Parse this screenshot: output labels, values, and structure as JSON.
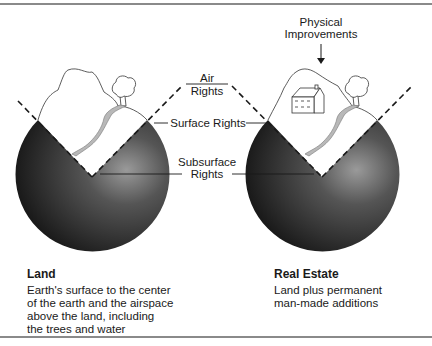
{
  "labels": {
    "physical_improvements_line1": "Physical",
    "physical_improvements_line2": "Improvements",
    "air_rights_line1": "Air",
    "air_rights_line2": "Rights",
    "surface_rights": "Surface Rights",
    "subsurface_rights_line1": "Subsurface",
    "subsurface_rights_line2": "Rights"
  },
  "left_panel": {
    "title": "Land",
    "description_lines": [
      "Earth's surface to the center",
      "of the earth and the airspace",
      "above the land, including",
      "the trees and water"
    ]
  },
  "right_panel": {
    "title": "Real Estate",
    "description_lines": [
      "Land plus permanent",
      "man-made additions"
    ]
  },
  "colors": {
    "sphere_dark": "#1c1c1c",
    "sphere_light": "#8f8f8f",
    "stream_fill": "#b8b8b8",
    "frame_line": "#8a8a8a"
  }
}
